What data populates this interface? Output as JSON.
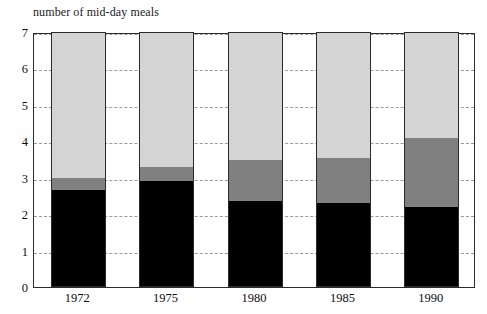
{
  "chart_data": {
    "type": "bar",
    "stacked": true,
    "title": "number of mid-day meals",
    "xlabel": "",
    "ylabel": "",
    "categories": [
      "1972",
      "1975",
      "1980",
      "1985",
      "1990"
    ],
    "ylim": [
      0,
      7
    ],
    "yticks": [
      "0",
      "1",
      "2",
      "3",
      "4",
      "5",
      "6",
      "7"
    ],
    "grid": true,
    "legend": "none",
    "series": [
      {
        "name": "black-segment",
        "color": "#000000",
        "values": [
          2.65,
          2.9,
          2.35,
          2.3,
          2.2
        ]
      },
      {
        "name": "gray-segment",
        "color": "#808080",
        "values": [
          0.35,
          0.4,
          1.15,
          1.25,
          1.9
        ]
      },
      {
        "name": "light-gray-segment",
        "color": "#d4d4d4",
        "values": [
          4.0,
          3.7,
          3.5,
          3.45,
          2.9
        ]
      }
    ],
    "cumulative_tops": [
      [
        2.65,
        3.0,
        7.0
      ],
      [
        2.9,
        3.3,
        7.0
      ],
      [
        2.35,
        3.5,
        7.0
      ],
      [
        2.3,
        3.55,
        7.0
      ],
      [
        2.2,
        4.1,
        7.0
      ]
    ],
    "totals": [
      7,
      7,
      7,
      7,
      7
    ]
  }
}
